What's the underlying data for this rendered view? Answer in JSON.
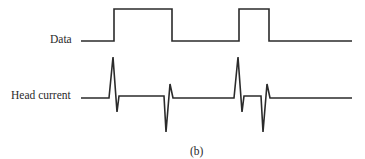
{
  "diagram": {
    "caption": "(b)",
    "signals": [
      {
        "name": "data",
        "label": "Data",
        "description": "Digital data waveform with two high pulses",
        "points": [
          [
            81,
            41
          ],
          [
            114,
            41
          ],
          [
            114,
            9
          ],
          [
            172,
            9
          ],
          [
            172,
            41
          ],
          [
            239,
            41
          ],
          [
            239,
            9
          ],
          [
            269,
            9
          ],
          [
            269,
            41
          ],
          [
            352,
            41
          ]
        ]
      },
      {
        "name": "head-current",
        "label": "Head current",
        "description": "Head current with spike/overshoot at each data transition",
        "points": [
          [
            81,
            98
          ],
          [
            109,
            98
          ],
          [
            113,
            57
          ],
          [
            117,
            112
          ],
          [
            119,
            96
          ],
          [
            164,
            96
          ],
          [
            166,
            132
          ],
          [
            170,
            84
          ],
          [
            173,
            98
          ],
          [
            234,
            98
          ],
          [
            238,
            57
          ],
          [
            242,
            112
          ],
          [
            244,
            96
          ],
          [
            261,
            96
          ],
          [
            263,
            132
          ],
          [
            267,
            84
          ],
          [
            270,
            98
          ],
          [
            352,
            98
          ]
        ]
      }
    ],
    "colors": {
      "stroke": "#2b2b2b",
      "text": "#2a2a2a",
      "background": "#ffffff"
    }
  }
}
